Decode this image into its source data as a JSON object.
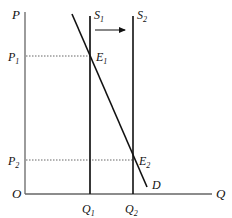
{
  "diagram": {
    "type": "supply-demand",
    "axes": {
      "y_label": "P",
      "x_label": "Q",
      "origin_label": "O"
    },
    "curves": {
      "supply_1": {
        "label": "S",
        "sub": "1"
      },
      "supply_2": {
        "label": "S",
        "sub": "2"
      },
      "demand": {
        "label": "D"
      }
    },
    "points": {
      "e1": {
        "label": "E",
        "sub": "1"
      },
      "e2": {
        "label": "E",
        "sub": "2"
      }
    },
    "prices": {
      "p1": {
        "label": "P",
        "sub": "1"
      },
      "p2": {
        "label": "P",
        "sub": "2"
      }
    },
    "quantities": {
      "q1": {
        "label": "Q",
        "sub": "1"
      },
      "q2": {
        "label": "Q",
        "sub": "2"
      }
    },
    "shift_arrow": "S1 → S2 (rightward supply shift)",
    "colors": {
      "axis": "#666666",
      "line": "#111111",
      "dotted": "#555555"
    }
  }
}
